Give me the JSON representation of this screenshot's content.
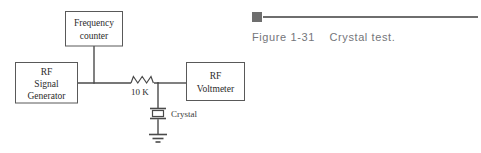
{
  "figure": {
    "caption_label": "Figure 1-31",
    "caption_title": "Crystal test.",
    "caption_full": "Figure 1-31    Crystal test.",
    "rule_color": "#6e6e6e"
  },
  "schematic": {
    "title": "Crystal test",
    "line_color": "#4a4a4a",
    "box_stroke_color": "#595959",
    "background_color": "#ffffff",
    "blocks": [
      {
        "id": "frequency-counter",
        "lines": [
          "Frequency",
          "counter"
        ],
        "line1": "Frequency",
        "line2": "counter"
      },
      {
        "id": "rf-signal-generator",
        "lines": [
          "RF",
          "Signal",
          "Generator"
        ],
        "line1": "RF",
        "line2": "Signal",
        "line3": "Generator"
      },
      {
        "id": "rf-voltmeter",
        "lines": [
          "RF",
          "Voltmeter"
        ],
        "line1": "RF",
        "line2": "Voltmeter"
      }
    ],
    "components": {
      "resistor_label": "10 K",
      "crystal_label": "Crystal",
      "ground_label": ""
    }
  }
}
